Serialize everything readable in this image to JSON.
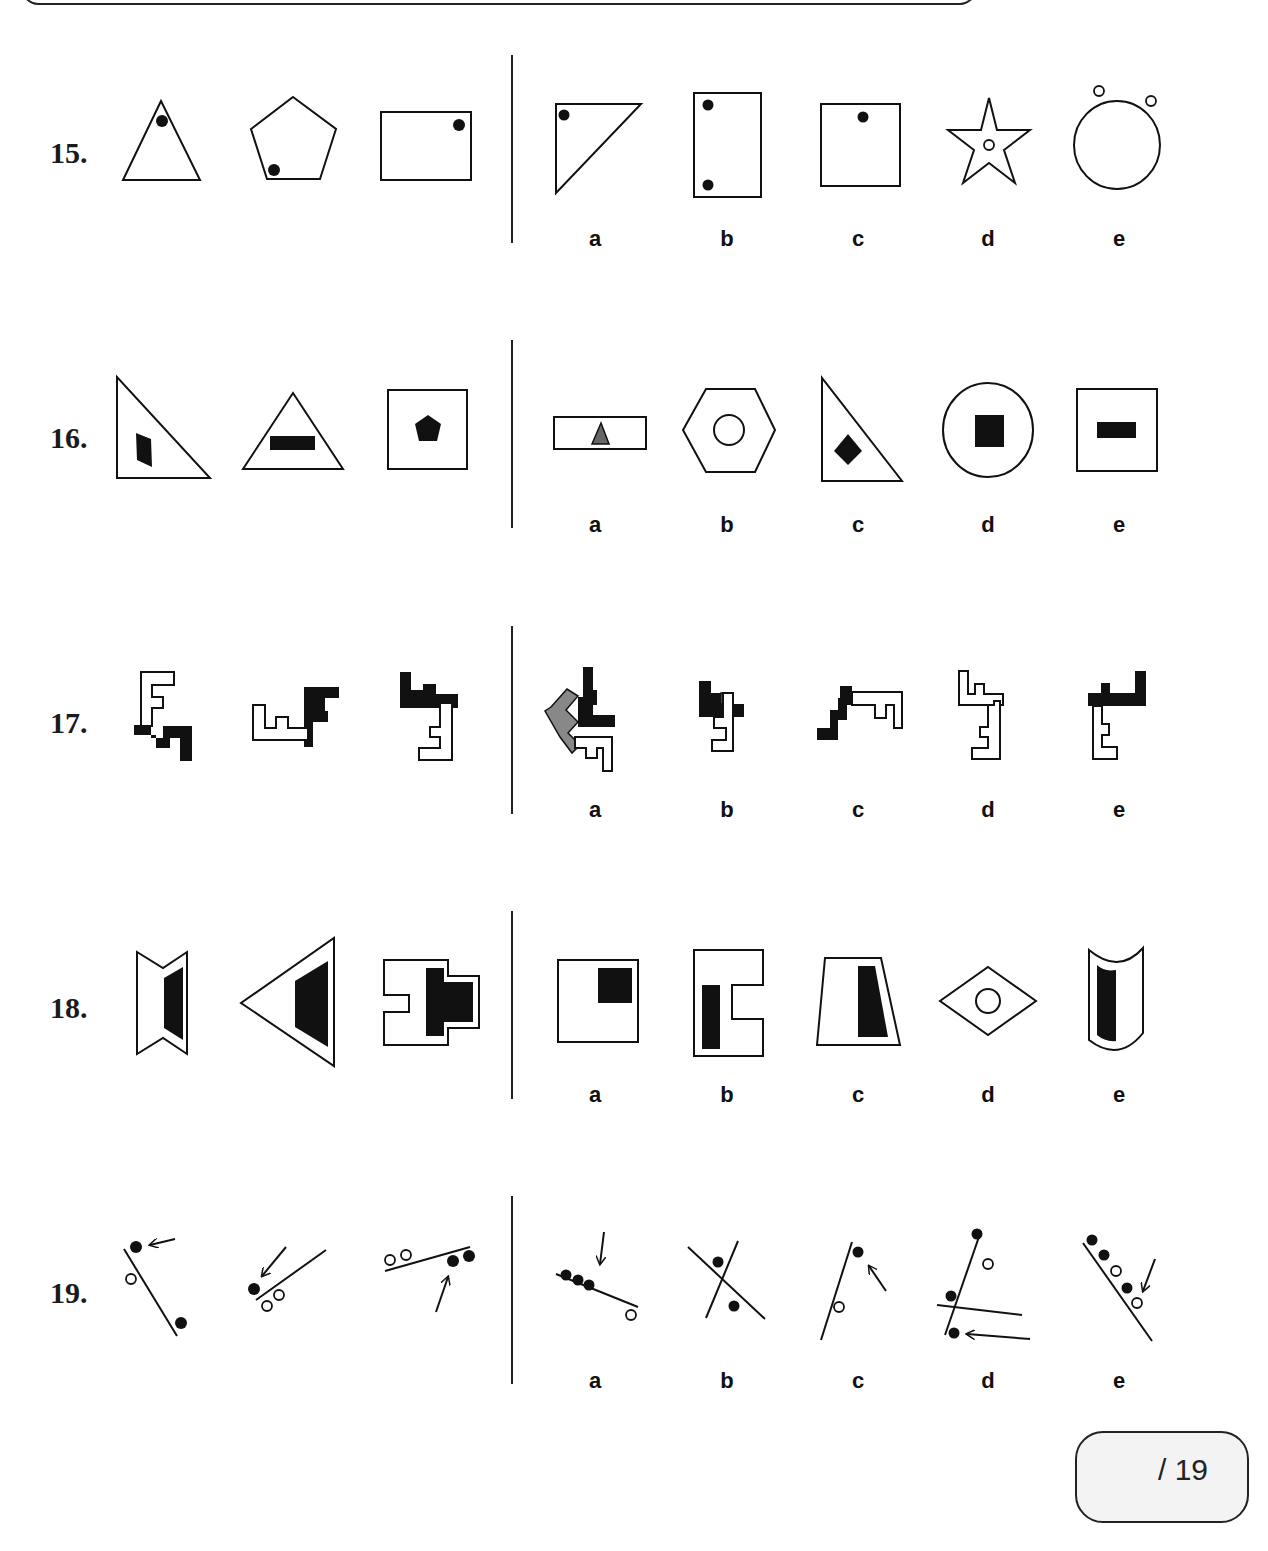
{
  "page": {
    "score_box": {
      "text": "/ 19"
    }
  },
  "questions": [
    {
      "number": "15.",
      "given": [
        "triangle with black dot near top vertex",
        "pentagon with black dot near bottom-left vertex",
        "rectangle with black dot near top-right corner"
      ],
      "options": [
        {
          "label": "a",
          "description": "right triangle with black dot near top-left corner"
        },
        {
          "label": "b",
          "description": "tall rectangle with two black dots at left corners"
        },
        {
          "label": "c",
          "description": "square with black dot near top edge center"
        },
        {
          "label": "d",
          "description": "star with small white circle in center"
        },
        {
          "label": "e",
          "description": "circle with two small white circles on top"
        }
      ]
    },
    {
      "number": "16.",
      "given": [
        "right triangle with black parallelogram",
        "triangle with black horizontal bar",
        "square with black pentagon"
      ],
      "options": [
        {
          "label": "a",
          "description": "wide rectangle with gray triangle"
        },
        {
          "label": "b",
          "description": "hexagon with white circle"
        },
        {
          "label": "c",
          "description": "right triangle with black diamond"
        },
        {
          "label": "d",
          "description": "circle with black square"
        },
        {
          "label": "e",
          "description": "square with black horizontal bar"
        }
      ]
    },
    {
      "number": "17.",
      "given": [
        "white E-shape above black stair shape",
        "white comb shape joined with black F-shape",
        "black L-shape above white E-shape"
      ],
      "options": [
        {
          "label": "a",
          "description": "black, gray and white pieces combined"
        },
        {
          "label": "b",
          "description": "black shape above white shape"
        },
        {
          "label": "c",
          "description": "black stair shape joined with white comb"
        },
        {
          "label": "d",
          "description": "two white outlined shapes"
        },
        {
          "label": "e",
          "description": "black shape above white E-shape"
        }
      ]
    },
    {
      "number": "18.",
      "given": [
        "bow-tie with black trapezoid",
        "triangle pointing left with black trapezoid",
        "notched shape with black cross shape"
      ],
      "options": [
        {
          "label": "a",
          "description": "rectangle with black square in top-right"
        },
        {
          "label": "b",
          "description": "C-shape with black vertical bar"
        },
        {
          "label": "c",
          "description": "trapezoid with black trapezoid"
        },
        {
          "label": "d",
          "description": "diamond with white circle"
        },
        {
          "label": "e",
          "description": "curved shield with black curved bar"
        }
      ]
    },
    {
      "number": "19.",
      "given": [
        "line with dots and arrow pointing at black dot",
        "line with dots and arrow pointing at black dot",
        "line with dots and arrow pointing at black dot"
      ],
      "options": [
        {
          "label": "a",
          "description": "line with three black dots, one white dot, arrow down"
        },
        {
          "label": "b",
          "description": "two crossing lines with two black dots"
        },
        {
          "label": "c",
          "description": "line with black dot, white dot and arrow"
        },
        {
          "label": "d",
          "description": "two lines, dots and arrow"
        },
        {
          "label": "e",
          "description": "line with five dots and arrow"
        }
      ]
    }
  ]
}
